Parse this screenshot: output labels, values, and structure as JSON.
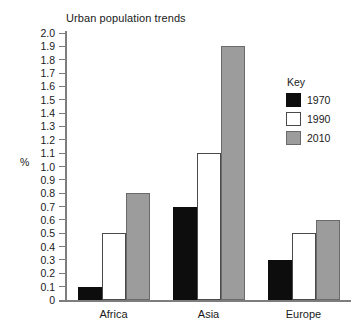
{
  "chart_data": {
    "type": "bar",
    "title": "Urban population trends",
    "xlabel": "",
    "ylabel": "%",
    "categories": [
      "Africa",
      "Asia",
      "Europe"
    ],
    "series": [
      {
        "name": "1970",
        "color": "#0d0d0d",
        "values": [
          0.1,
          0.7,
          0.3
        ]
      },
      {
        "name": "1990",
        "color": "#ffffff",
        "values": [
          0.5,
          1.1,
          0.5
        ]
      },
      {
        "name": "2010",
        "color": "#9c9c9c",
        "values": [
          0.8,
          1.9,
          0.6
        ]
      }
    ],
    "ylim": [
      0,
      2.0
    ],
    "ytick_step": 0.1,
    "ytick_labels": [
      "2.0",
      "1.9",
      "1.8",
      "1.7",
      "1.6",
      "1.5",
      "1.4",
      "1.3",
      "1.2",
      "1.1",
      "1.0",
      "0.9",
      "0.8",
      "0.7",
      "0.6",
      "0.5",
      "0.4",
      "0.3",
      "0.2",
      "0.1",
      "0"
    ],
    "grid": false,
    "legend": {
      "title": "Key",
      "position": "top-right",
      "entries": [
        "1970",
        "1990",
        "2010"
      ]
    }
  }
}
